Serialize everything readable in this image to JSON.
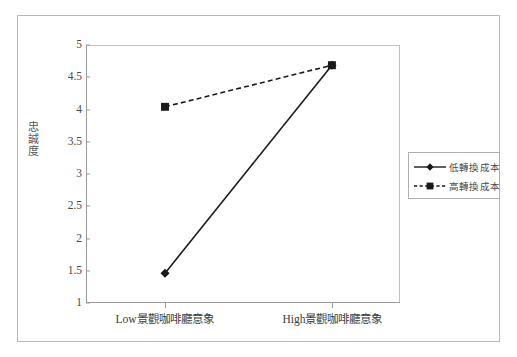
{
  "chart_data": {
    "type": "line",
    "title": "",
    "subtitle": "",
    "xlabel": "",
    "ylabel": "忠誠度",
    "categories": [
      "Low景觀咖啡廳意象",
      "High景觀咖啡廳意象"
    ],
    "ylim": [
      1,
      5
    ],
    "ytick_labels": [
      "1",
      "1.5",
      "2",
      "2.5",
      "3",
      "3.5",
      "4",
      "4.5",
      "5"
    ],
    "ytick_values": [
      1,
      1.5,
      2,
      2.5,
      3,
      3.5,
      4,
      4.5,
      5
    ],
    "grid": false,
    "legend_position": "right",
    "series": [
      {
        "name": "低轉換成本",
        "values": [
          1.45,
          4.7
        ],
        "line_style": "solid",
        "marker": "diamond",
        "color": "#1a1a1a"
      },
      {
        "name": "高轉換成本",
        "values": [
          4.05,
          4.7
        ],
        "line_style": "dashed",
        "marker": "square",
        "color": "#1a1a1a"
      }
    ]
  },
  "legend": {
    "items": [
      {
        "label": "低轉換成本",
        "style": "solid",
        "marker": "diamond"
      },
      {
        "label": "高轉換成本",
        "style": "dashed",
        "marker": "square"
      }
    ]
  },
  "colors": {
    "frame": "#b9b9b9",
    "axis": "#9a9a9a",
    "series": "#1a1a1a",
    "text": "#4a4a4a",
    "background": "#ffffff"
  }
}
